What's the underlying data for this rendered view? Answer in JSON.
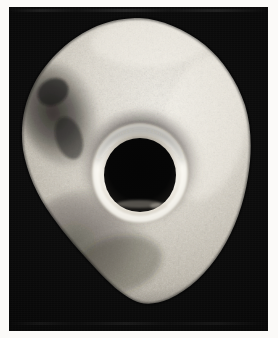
{
  "figure": {
    "kind": "photograph",
    "medium": "black-and-white halftone print",
    "subject_name": "perforated stone object",
    "subject_description": "Roughly pentagonal water-worn stone with a large, smoothly bored central perforation; coarse granular surface with a dark weathered patch on the upper left and a brighter polished zone on the right flank.",
    "caption": "",
    "plate_background_color": "#080808",
    "paper_color": "#fbfaf8",
    "highlight_color": "#f2efe9",
    "midtone_color": "#b9b4aa",
    "shadow_color": "#141414",
    "aperture_color": "#050505"
  },
  "plate": {
    "x": 9,
    "y": 7,
    "width": 259,
    "height": 324,
    "name": "photographic-plate"
  },
  "specimen": {
    "name": "perforated-stone",
    "outline_label": "stone silhouette",
    "bounds": {
      "left": 13,
      "top": 11,
      "right": 243,
      "bottom": 296
    },
    "surface_label": "granular stone surface",
    "dark_patch_label": "weathered dark patch",
    "bright_flank_label": "polished right flank"
  },
  "perforation": {
    "name": "central-perforation",
    "center_x": 131,
    "center_y": 165,
    "outer_rim_radius": 58,
    "bright_ring_radius": 46,
    "aperture_radius": 35,
    "rim_label": "bevelled bright rim",
    "aperture_label": "dark bore opening",
    "inner_highlight_label": "interior bore highlight"
  },
  "labels": {
    "figure_number": "",
    "scale_note": "",
    "credit": ""
  }
}
